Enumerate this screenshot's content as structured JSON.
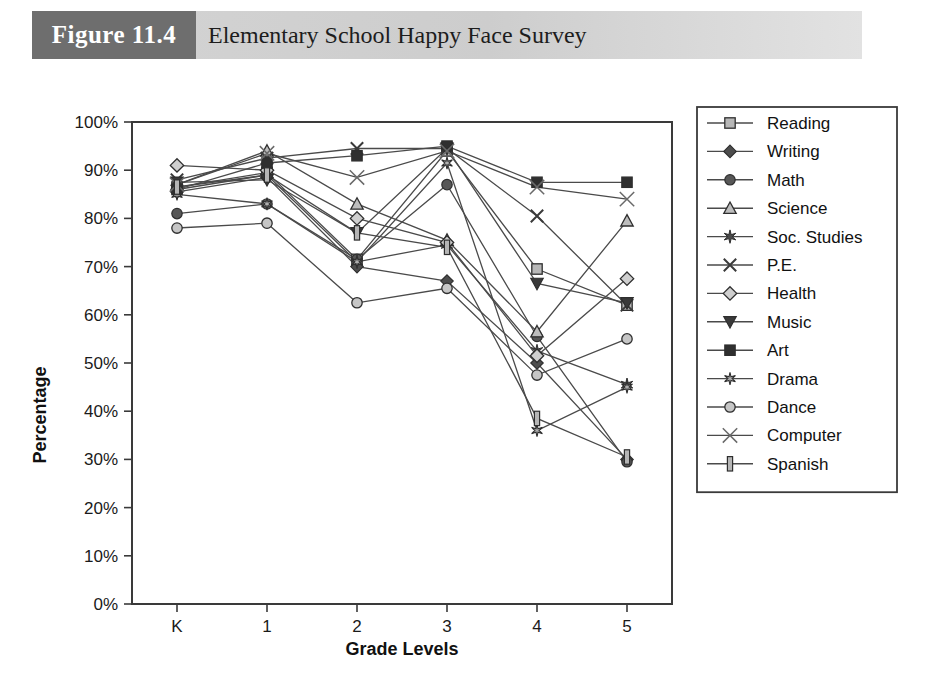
{
  "header": {
    "figure_tag": "Figure 11.4",
    "title": "Elementary School Happy Face Survey",
    "tag_bg_color": "#6e6e6e",
    "band_bg_color": "#d4d4d4"
  },
  "chart_data": {
    "type": "line",
    "title": "Elementary School Happy Face Survey",
    "xlabel": "Grade Levels",
    "ylabel": "Percentage",
    "categories": [
      "K",
      "1",
      "2",
      "3",
      "4",
      "5"
    ],
    "x": [
      "K",
      "1",
      "2",
      "3",
      "4",
      "5"
    ],
    "ylim": [
      0,
      100
    ],
    "ytick_labels": [
      "0%",
      "10%",
      "20%",
      "30%",
      "40%",
      "50%",
      "60%",
      "70%",
      "80%",
      "90%",
      "100%"
    ],
    "ytick_values": [
      0,
      10,
      20,
      30,
      40,
      50,
      60,
      70,
      80,
      90,
      100
    ],
    "grid": false,
    "legend_position": "right",
    "value_unit": "%",
    "series": [
      {
        "name": "Reading",
        "marker": "square-light",
        "values": [
          86.5,
          89.5,
          71.5,
          94.0,
          69.5,
          62.0
        ]
      },
      {
        "name": "Writing",
        "marker": "diamond-dark",
        "values": [
          85.5,
          88.5,
          70.0,
          67.0,
          50.0,
          30.0
        ]
      },
      {
        "name": "Math",
        "marker": "circle-dark",
        "values": [
          81.0,
          83.0,
          71.5,
          87.0,
          55.5,
          29.5
        ]
      },
      {
        "name": "Science",
        "marker": "triangle-light",
        "values": [
          87.0,
          94.0,
          83.0,
          75.5,
          56.5,
          79.5
        ]
      },
      {
        "name": "Soc. Studies",
        "marker": "star-dark",
        "values": [
          86.0,
          89.0,
          71.0,
          74.5,
          52.5,
          45.5
        ]
      },
      {
        "name": "P.E.",
        "marker": "x-mark",
        "values": [
          88.0,
          92.5,
          94.5,
          94.5,
          80.5,
          62.0
        ]
      },
      {
        "name": "Health",
        "marker": "diamond-light",
        "values": [
          91.0,
          90.0,
          80.0,
          75.0,
          51.5,
          67.5
        ]
      },
      {
        "name": "Music",
        "marker": "triangle-down",
        "values": [
          87.5,
          88.0,
          77.0,
          94.5,
          66.5,
          62.5
        ]
      },
      {
        "name": "Art",
        "marker": "square-dark",
        "values": [
          86.0,
          91.5,
          93.0,
          95.0,
          87.5,
          87.5
        ]
      },
      {
        "name": "Drama",
        "marker": "star-small",
        "values": [
          85.0,
          83.0,
          71.0,
          91.5,
          36.0,
          45.0
        ]
      },
      {
        "name": "Dance",
        "marker": "circle-light",
        "values": [
          78.0,
          79.0,
          62.5,
          65.5,
          47.5,
          55.0
        ]
      },
      {
        "name": "Computer",
        "marker": "x-thin",
        "values": [
          87.0,
          93.5,
          88.5,
          94.0,
          86.5,
          84.0
        ]
      },
      {
        "name": "Spanish",
        "marker": "bar-vertical",
        "values": [
          86.5,
          89.0,
          77.0,
          74.0,
          38.5,
          30.5
        ]
      }
    ]
  },
  "legend": {
    "items": [
      {
        "label": "Reading"
      },
      {
        "label": "Writing"
      },
      {
        "label": "Math"
      },
      {
        "label": "Science"
      },
      {
        "label": "Soc. Studies"
      },
      {
        "label": "P.E."
      },
      {
        "label": "Health"
      },
      {
        "label": "Music"
      },
      {
        "label": "Art"
      },
      {
        "label": "Drama"
      },
      {
        "label": "Dance"
      },
      {
        "label": "Computer"
      },
      {
        "label": "Spanish"
      }
    ]
  },
  "colors": {
    "line": "#4a4a4a",
    "axis": "#3a3a3a",
    "marker_dark": "#3f3f3f",
    "marker_light": "#b8b8b8",
    "text": "#111111"
  }
}
